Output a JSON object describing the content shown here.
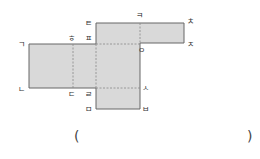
{
  "diagram": {
    "type": "net-of-cuboid",
    "fill_color": "#d9d9d9",
    "stroke_color": "#666666",
    "dashed_color": "#888888",
    "labels": {
      "giyeok": "ㄱ",
      "nieun": "ㄴ",
      "digeut": "ㄷ",
      "rieul": "ㄹ",
      "mieum": "ㅁ",
      "bieup": "ㅂ",
      "siot": "ㅅ",
      "ieung": "ㅇ",
      "jieut": "ㅈ",
      "chieut": "ㅊ",
      "kieuk": "ㅋ",
      "tieut": "ㅌ",
      "pieup": "ㅍ",
      "hieut": "ㅎ"
    }
  },
  "answer": {
    "open_paren": "(",
    "close_paren": ")",
    "value": ""
  }
}
